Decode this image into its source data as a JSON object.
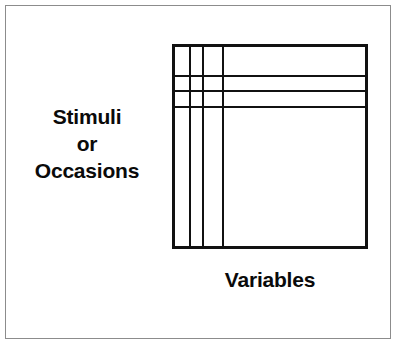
{
  "figure": {
    "width": 398,
    "height": 349,
    "background_color": "#ffffff",
    "frame_color": "#8c8c8c",
    "line_color": "#111111",
    "text_color": "#0a0a0a"
  },
  "labels": {
    "row_axis": {
      "line1": "Stimuli",
      "line2": "or",
      "line3": "Occasions"
    },
    "column_axis": "Variables"
  },
  "chart_data": {
    "type": "diagram",
    "title": "",
    "box": {
      "x": 172,
      "y": 44,
      "width": 196,
      "height": 205,
      "border_width": 3
    },
    "vertical_dividers": [
      14,
      27,
      47
    ],
    "horizontal_dividers": [
      28,
      43,
      59
    ],
    "divider_width": 2,
    "xlabel": "Variables",
    "ylabel": "Stimuli or Occasions",
    "grid": true,
    "legend": "none"
  }
}
